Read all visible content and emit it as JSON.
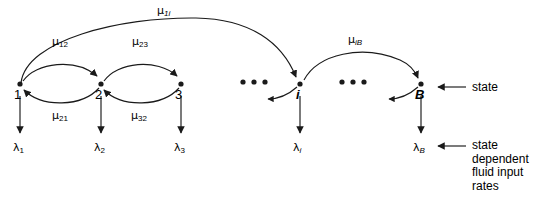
{
  "diagram": {
    "type": "markov-chain-state-diagram",
    "stroke_color": "#1a1a1a",
    "background_color": "#ffffff",
    "nodes": [
      {
        "id": "n1",
        "label": "1",
        "italic": false,
        "x": 20,
        "y": 84
      },
      {
        "id": "n2",
        "label": "2",
        "italic": false,
        "x": 101,
        "y": 84
      },
      {
        "id": "n3",
        "label": "3",
        "italic": false,
        "x": 181,
        "y": 84
      },
      {
        "id": "ni",
        "label": "i",
        "italic": true,
        "x": 300,
        "y": 84
      },
      {
        "id": "nB",
        "label": "B",
        "italic": true,
        "x": 421,
        "y": 84
      }
    ],
    "ellipses": [
      {
        "id": "e1",
        "x": 243,
        "y": 82
      },
      {
        "id": "e2",
        "x": 342,
        "y": 82
      }
    ],
    "transition_labels": [
      {
        "id": "mu_1i",
        "mu": "μ",
        "sub": "1i",
        "sub_italic": true,
        "x": 157,
        "y": 5
      },
      {
        "id": "mu_12",
        "mu": "μ",
        "sub": "12",
        "sub_italic": false,
        "x": 52,
        "y": 36
      },
      {
        "id": "mu_23",
        "mu": "μ",
        "sub": "23",
        "sub_italic": false,
        "x": 132,
        "y": 36
      },
      {
        "id": "mu_iB",
        "mu": "μ",
        "sub": "iB",
        "sub_italic": true,
        "x": 348,
        "y": 34
      },
      {
        "id": "mu_21",
        "mu": "μ",
        "sub": "21",
        "sub_italic": false,
        "x": 52,
        "y": 110
      },
      {
        "id": "mu_32",
        "mu": "μ",
        "sub": "32",
        "sub_italic": false,
        "x": 131,
        "y": 110
      }
    ],
    "rate_labels": [
      {
        "id": "lam_1",
        "lam": "λ",
        "sub": "1",
        "sub_italic": false,
        "x": 13,
        "y": 142
      },
      {
        "id": "lam_2",
        "lam": "λ",
        "sub": "2",
        "sub_italic": false,
        "x": 94,
        "y": 142
      },
      {
        "id": "lam_3",
        "lam": "λ",
        "sub": "3",
        "sub_italic": false,
        "x": 174,
        "y": 142
      },
      {
        "id": "lam_i",
        "lam": "λ",
        "sub": "i",
        "sub_italic": true,
        "x": 293,
        "y": 142
      },
      {
        "id": "lam_B",
        "lam": "λ",
        "sub": "B",
        "sub_italic": true,
        "x": 413,
        "y": 142
      }
    ],
    "annotations": {
      "state": {
        "text": "state",
        "x": 472,
        "y": 82
      },
      "rates": {
        "lines": [
          "state",
          "dependent",
          "fluid input",
          "rates"
        ],
        "x": 472,
        "y": 139
      }
    }
  }
}
